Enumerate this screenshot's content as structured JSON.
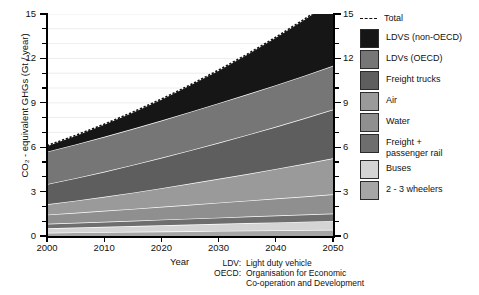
{
  "chart_data": {
    "type": "area",
    "title": "",
    "xlabel": "Year",
    "ylabel": "CO₂ - equivalent GHGs (Gt / year)",
    "xlim": [
      2000,
      2050
    ],
    "ylim": [
      0,
      15
    ],
    "ytick_values": [
      0,
      3,
      6,
      9,
      12,
      15
    ],
    "ytick_labels": [
      "0",
      "3",
      "6",
      "9",
      "12",
      "15"
    ],
    "ytick_minor_step": 1,
    "xtick_values": [
      2000,
      2010,
      2020,
      2030,
      2040,
      2050
    ],
    "xtick_labels": [
      "2000",
      "2010",
      "2020",
      "2030",
      "2040",
      "2050"
    ],
    "grid": "horizontal-light",
    "legend_position": "right",
    "stacked": true,
    "x": [
      2000,
      2005,
      2010,
      2015,
      2020,
      2025,
      2030,
      2035,
      2040,
      2045,
      2050
    ],
    "series": [
      {
        "name": "2 - 3 wheelers",
        "color": "#a6a6a6",
        "values": [
          0.22,
          0.24,
          0.26,
          0.28,
          0.3,
          0.32,
          0.34,
          0.36,
          0.38,
          0.4,
          0.42
        ]
      },
      {
        "name": "Buses",
        "color": "#d4d4d4",
        "values": [
          0.3,
          0.33,
          0.36,
          0.39,
          0.42,
          0.45,
          0.48,
          0.51,
          0.54,
          0.57,
          0.6
        ]
      },
      {
        "name": "Freight + passenger rail",
        "color": "#6e6e6e",
        "values": [
          0.3,
          0.32,
          0.34,
          0.36,
          0.38,
          0.4,
          0.42,
          0.44,
          0.46,
          0.48,
          0.5
        ]
      },
      {
        "name": "Water",
        "color": "#8f8f8f",
        "values": [
          0.62,
          0.68,
          0.74,
          0.8,
          0.87,
          0.94,
          1.01,
          1.08,
          1.15,
          1.22,
          1.3
        ]
      },
      {
        "name": "Air",
        "color": "#9a9a9a",
        "values": [
          0.7,
          0.82,
          0.95,
          1.1,
          1.26,
          1.43,
          1.61,
          1.8,
          2.0,
          2.21,
          2.43
        ]
      },
      {
        "name": "Freight trucks",
        "color": "#5e5e5e",
        "values": [
          1.36,
          1.52,
          1.69,
          1.87,
          2.05,
          2.24,
          2.44,
          2.64,
          2.85,
          3.07,
          3.3
        ]
      },
      {
        "name": "LDVs (OECD)",
        "color": "#767676",
        "values": [
          2.2,
          2.28,
          2.36,
          2.44,
          2.52,
          2.6,
          2.67,
          2.74,
          2.81,
          2.88,
          2.95
        ]
      },
      {
        "name": "LDVS (non-OECD)",
        "color": "#161616",
        "values": [
          0.4,
          0.61,
          0.85,
          1.13,
          1.45,
          1.82,
          2.24,
          2.71,
          3.24,
          3.82,
          4.45
        ]
      }
    ],
    "total_line": {
      "name": "Total",
      "style": "dashed",
      "color": "#111111",
      "values": [
        6.1,
        6.8,
        7.55,
        8.37,
        9.25,
        10.2,
        11.21,
        12.28,
        13.43,
        14.65,
        15.95
      ]
    }
  },
  "axes": {
    "y_title": "CO₂ - equivalent GHGs (Gt / year)",
    "x_title": "Year",
    "y_labels": [
      "15",
      "12",
      "9",
      "6",
      "3",
      "0"
    ],
    "x_labels": [
      "2000",
      "2010",
      "2020",
      "2030",
      "2040",
      "2050"
    ]
  },
  "legend": {
    "items": [
      {
        "label": "Total",
        "swatch": "dashed-line",
        "color": "#111111"
      },
      {
        "label": "LDVS (non-OECD)",
        "swatch": "box",
        "color": "#161616"
      },
      {
        "label": "LDVs (OECD)",
        "swatch": "box",
        "color": "#767676"
      },
      {
        "label": "Freight trucks",
        "swatch": "box",
        "color": "#5e5e5e"
      },
      {
        "label": "Air",
        "swatch": "box",
        "color": "#9a9a9a"
      },
      {
        "label": "Water",
        "swatch": "box",
        "color": "#8f8f8f"
      },
      {
        "label": "Freight +\npassenger rail",
        "swatch": "box",
        "color": "#6e6e6e"
      },
      {
        "label": "Buses",
        "swatch": "box",
        "color": "#d4d4d4"
      },
      {
        "label": "2 - 3 wheelers",
        "swatch": "box",
        "color": "#a6a6a6"
      }
    ]
  },
  "footnote": {
    "rows": [
      {
        "key": "LDV:",
        "value": "Light duty vehicle"
      },
      {
        "key": "OECD:",
        "value": "Organisation for Economic"
      },
      {
        "key": "",
        "value": "Co-operation and Development"
      }
    ]
  }
}
